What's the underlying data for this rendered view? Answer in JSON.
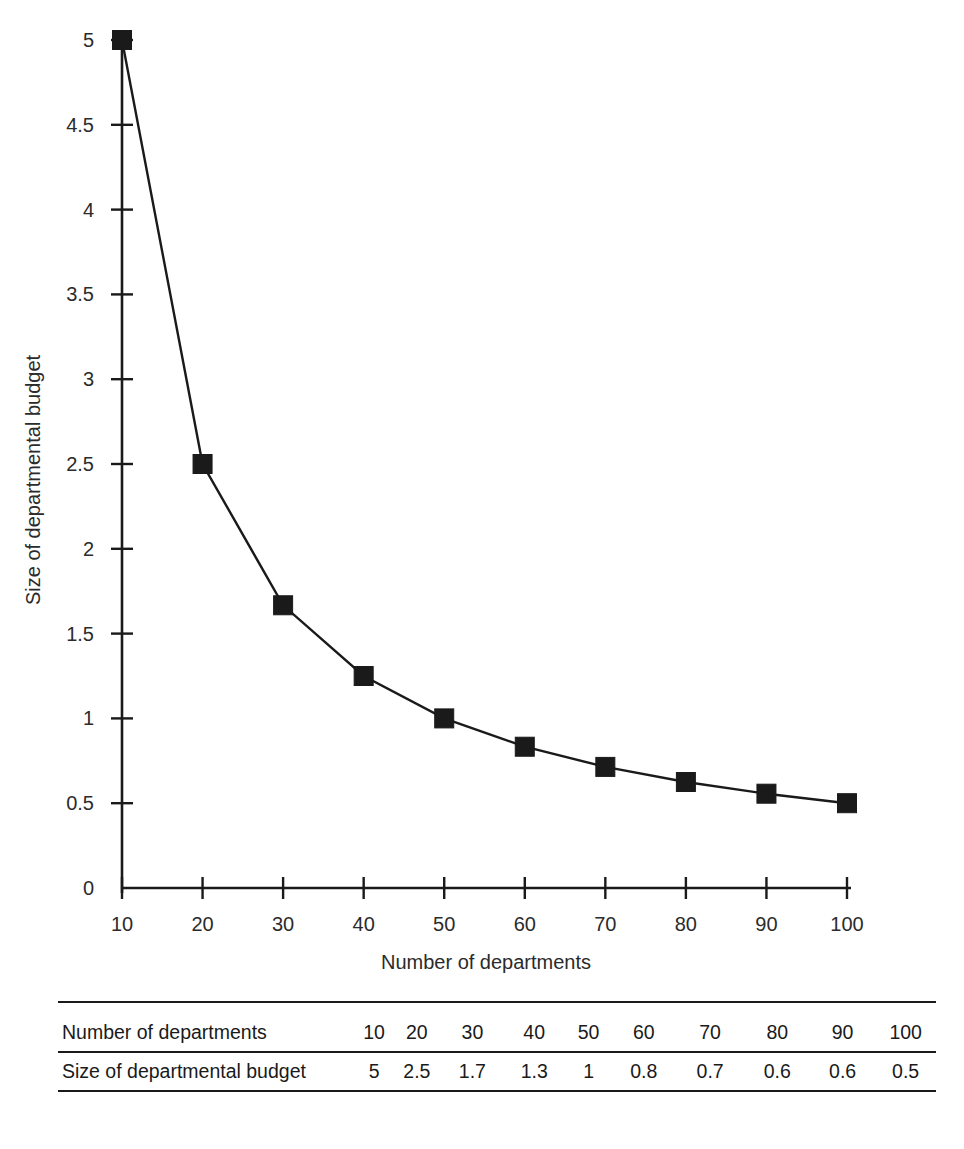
{
  "chart_data": {
    "type": "line",
    "title": "",
    "subtitle": "",
    "xlabel": "Number of departments",
    "ylabel": "Size of departmental budget",
    "x": [
      10,
      20,
      30,
      40,
      50,
      60,
      70,
      80,
      90,
      100
    ],
    "values": [
      5,
      2.5,
      1.7,
      1.3,
      1,
      0.8,
      0.7,
      0.6,
      0.6,
      0.5
    ],
    "plotted_values": [
      5,
      2.5,
      1.667,
      1.25,
      1,
      0.833,
      0.714,
      0.625,
      0.556,
      0.5
    ],
    "series": [
      {
        "name": "Size of departmental budget",
        "values": [
          5,
          2.5,
          1.7,
          1.3,
          1,
          0.8,
          0.7,
          0.6,
          0.6,
          0.5
        ],
        "color": "#1a1a1a",
        "marker": "square"
      }
    ],
    "xlim": [
      10,
      100
    ],
    "ylim": [
      0,
      5
    ],
    "xticks": [
      10,
      20,
      30,
      40,
      50,
      60,
      70,
      80,
      90,
      100
    ],
    "yticks": [
      0,
      0.5,
      1,
      1.5,
      2,
      2.5,
      3,
      3.5,
      4,
      4.5,
      5
    ],
    "xtick_labels": [
      "10",
      "20",
      "30",
      "40",
      "50",
      "60",
      "70",
      "80",
      "90",
      "100"
    ],
    "ytick_labels": [
      "0",
      "0.5",
      "1",
      "1.5",
      "2",
      "2.5",
      "3",
      "3.5",
      "4",
      "4.5",
      "5"
    ],
    "grid": false,
    "legend": false,
    "legend_position": "none",
    "line_color": "#1a1a1a",
    "marker_color": "#1a1a1a",
    "background_color": "#ffffff"
  },
  "table": {
    "rows": [
      {
        "label": "Number of departments",
        "cells": [
          "10",
          "20",
          "30",
          "40",
          "50",
          "60",
          "70",
          "80",
          "90",
          "100"
        ]
      },
      {
        "label": "Size of departmental budget",
        "cells": [
          "5",
          "2.5",
          "1.7",
          "1.3",
          "1",
          "0.8",
          "0.7",
          "0.6",
          "0.6",
          "0.5"
        ]
      }
    ]
  }
}
